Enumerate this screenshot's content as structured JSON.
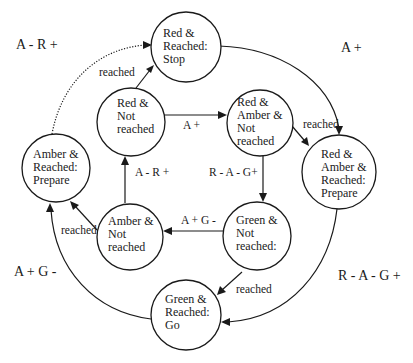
{
  "diagram": {
    "type": "state-transition-diagram",
    "nodes": [
      {
        "id": "red_reached",
        "lines": [
          "Red &",
          "Reached:",
          "Stop"
        ]
      },
      {
        "id": "red_not_reached",
        "lines": [
          "Red &",
          "Not",
          "reached"
        ]
      },
      {
        "id": "red_amber_not_reached",
        "lines": [
          "Red &",
          "Amber &",
          "Not",
          "reached"
        ]
      },
      {
        "id": "red_amber_reached",
        "lines": [
          "Red &",
          "Amber &",
          "Reached:",
          "Prepare"
        ]
      },
      {
        "id": "amber_reached",
        "lines": [
          "Amber &",
          "Reached:",
          "Prepare"
        ]
      },
      {
        "id": "amber_not_reached",
        "lines": [
          "Amber &",
          "Not",
          "reached"
        ]
      },
      {
        "id": "green_not_reached",
        "lines": [
          "Green &",
          "Not",
          "reached:"
        ]
      },
      {
        "id": "green_reached",
        "lines": [
          "Green &",
          "Reached:",
          "Go"
        ]
      }
    ],
    "edge_labels": {
      "red_not_to_red_amber_not": "A +",
      "red_not_to_red_reached": "reached",
      "red_amber_not_to_red_amber_reached": "reached",
      "red_amber_not_to_green_not": "R -  A -  G+",
      "green_not_to_amber_not": "A +  G -",
      "amber_not_to_red_not": "A -  R +",
      "amber_not_to_amber_reached": "reached",
      "green_not_to_green_reached": "reached"
    },
    "side_labels": {
      "amber_reached_to_red_reached": "A -  R +",
      "red_reached_to_red_amber_reached": "A +",
      "green_reached_to_amber_reached": "A +  G -",
      "red_amber_reached_to_green_reached": "R -  A -  G +"
    }
  }
}
